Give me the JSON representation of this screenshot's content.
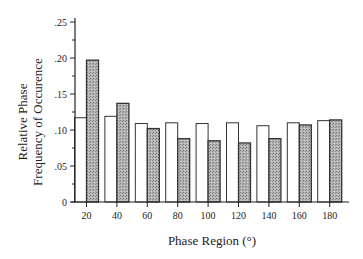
{
  "chart_data": {
    "type": "bar",
    "title": "",
    "xlabel": "Phase Region (°)",
    "ylabel": [
      "Relative Phase",
      "Frequency of Occurence"
    ],
    "categories": [
      "20",
      "40",
      "60",
      "80",
      "100",
      "120",
      "140",
      "160",
      "180"
    ],
    "series": [
      {
        "name": "open",
        "fill": "#ffffff",
        "values": [
          0.117,
          0.119,
          0.109,
          0.11,
          0.109,
          0.11,
          0.106,
          0.11,
          0.113
        ]
      },
      {
        "name": "hatched",
        "fill": "#a9a9a9",
        "values": [
          0.197,
          0.137,
          0.102,
          0.088,
          0.085,
          0.082,
          0.088,
          0.107,
          0.114
        ]
      }
    ],
    "ylim": [
      0,
      0.25
    ],
    "yticks": [
      "0",
      ".05",
      ".10",
      ".15",
      ".20",
      ".25"
    ],
    "ytick_values": [
      0,
      0.05,
      0.1,
      0.15,
      0.2,
      0.25
    ],
    "minor_yticks": true,
    "grid": false,
    "legend": null
  }
}
